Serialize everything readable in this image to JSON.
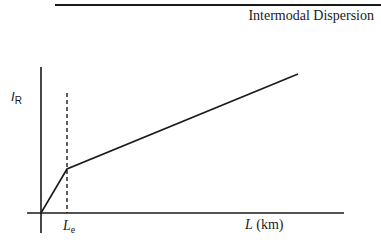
{
  "header": {
    "title": "Intermodal Dispersion"
  },
  "diagram": {
    "y_axis_label": {
      "main": "I",
      "sub": "R"
    },
    "x_axis_label": {
      "var": "L",
      "unit": "(km)"
    },
    "marker_label": {
      "main": "L",
      "sub": "e"
    },
    "curve": {
      "description": "Piecewise linear: steep rise from origin to L_e, then shallower linear increase",
      "points": [
        [
          0,
          0
        ],
        [
          1,
          0.29
        ],
        [
          9.9,
          0.95
        ]
      ]
    },
    "dashed_marker": "L_e",
    "colors": {
      "line": "#1a1a1a",
      "background": "#ffffff"
    }
  }
}
